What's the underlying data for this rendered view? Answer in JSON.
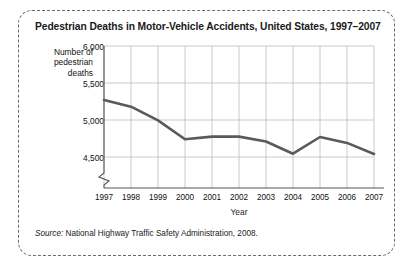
{
  "figure": {
    "title": "Pedestrian Deaths in Motor-Vehicle Accidents, United States, 1997–2007",
    "source_prefix": "Source:",
    "source_text": " National Highway Traffic Safety Administration, 2008.",
    "border_color": "#6b6b6b"
  },
  "chart_data": {
    "type": "line",
    "title": "Pedestrian Deaths in Motor-Vehicle Accidents, United States, 1997–2007",
    "xlabel": "Year",
    "ylabel": "Number of pedestrian deaths",
    "ylabel_lines": [
      "Number of",
      "pedestrian",
      "deaths"
    ],
    "categories": [
      "1997",
      "1998",
      "1999",
      "2000",
      "2001",
      "2002",
      "2003",
      "2004",
      "2005",
      "2006",
      "2007"
    ],
    "values": [
      5270,
      5180,
      4995,
      4740,
      4775,
      4775,
      4710,
      4545,
      4770,
      4690,
      4540
    ],
    "ylim": [
      4250,
      6000
    ],
    "yticks": [
      6000,
      5500,
      5000,
      4500
    ],
    "ytick_labels": [
      "6,000",
      "5,500",
      "5,000",
      "4,500"
    ],
    "axis_break": true,
    "grid": true,
    "grid_color": "#b9b9b9",
    "line_color": "#5a5a5a",
    "legend": "none"
  }
}
